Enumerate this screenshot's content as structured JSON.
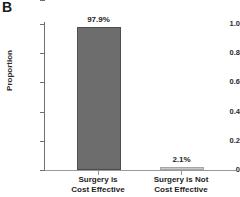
{
  "panel": {
    "label": "B"
  },
  "chart_data": {
    "type": "bar",
    "title": "",
    "subtitle": "",
    "xlabel": "",
    "ylabel": "Proportion",
    "ylim": [
      0,
      1.0
    ],
    "grid": false,
    "legend": "none",
    "categories": [
      "Surgery is Cost Effective",
      "Surgery is Not Cost Effective"
    ],
    "category_lines": [
      [
        "Surgery is",
        "Cost Effective"
      ],
      [
        "Surgery is Not",
        "Cost Effective"
      ]
    ],
    "values": [
      0.979,
      0.021
    ],
    "data_labels": [
      "97.9%",
      "2.1%"
    ],
    "ytick_labels": [
      "1.0",
      "0.8",
      "0.6",
      "0.4",
      "0.2",
      "0"
    ],
    "ytick_values": [
      1.0,
      0.8,
      0.6,
      0.4,
      0.2,
      0
    ],
    "bar_colors": [
      "#6d6d6d",
      "#c9c9c9"
    ],
    "bar_edge_colors": [
      "#4d4d4d",
      "#a6a6a6"
    ],
    "axis_color": "#707070",
    "text_color": "#232323",
    "background": "#ffffff"
  }
}
